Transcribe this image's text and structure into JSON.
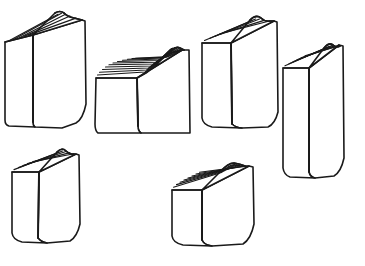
{
  "illustration": {
    "title": "Six books line drawing",
    "subject": "books",
    "style": "black-and-white hand-drawn line art",
    "item_count": 6,
    "rows": 2,
    "columns": 3,
    "canvas": {
      "width": 365,
      "height": 266
    },
    "colors": {
      "background": "#ffffff",
      "stroke": "#1a1a1a",
      "fill": "#ffffff"
    },
    "stroke_width": 1.6
  },
  "books": [
    {
      "name": "book-top-left",
      "row": 1,
      "column": 1,
      "proportion": "tall-medium-thickness",
      "page_line_count": 5,
      "geometry": {
        "cover_path": "M33 35 L82 20 L85 21 L86 104 Q83 119 76 123 L62 128 L35 127 Q33 126 33 122 Z",
        "spine_path": "M5 42 L33 35 L33 122 Q33 126 35 127 L9 126 Q5 125 5 120 Z",
        "top_face_path": "M5 42 L33 35 L55 13 Q60 10 64 13 Q68 17 74 18 L82 20 L33 35 Z",
        "spine_fold": "M33 35 L33 122",
        "page_lines": [
          "M9 40.8 L58 14.2",
          "M14 39.3 L61.5 13.3",
          "M19 37.9 L65 14.5",
          "M24 36.4 L70 16.0",
          "M28.5 35.1 L76 18.1"
        ],
        "top_rear_edge": "M55 13 Q60 10 64 13 Q68 17 74 18 L82 20"
      }
    },
    {
      "name": "book-top-center",
      "row": 1,
      "column": 2,
      "proportion": "thick-deep-top",
      "page_line_count": 11,
      "geometry": {
        "cover_path": "M137 78 L182 50 L189 50 L190 133 L141 133 Q138 131 138 126 Z",
        "spine_path": "M96 78 L137 78 L138 126 Q138 131 141 133 L98 133 Q95 131 95 124 Z",
        "top_face_path": "M96 78 L137 78 L146 73 Q152 69 158 63 L172 50 Q176 46 180 48 L184 50 L182 50 L137 78 Z",
        "spine_fold": "M137 78 L138 126",
        "page_lines": [
          "M97.5 75.0 L145.0 72.0 Q152 68 158 62 L170.5 49.5",
          "M99.5 72.2 L146.5 70.0 Q153 66 159 60.5 L171.5 48.5",
          "M102.5 69.5 L148.5 68.0 Q155 64 160.5 59.0 L173 48.0",
          "M105.5 67.0 L151.0 66.0 Q157 62 162.5 57.5 L175 47.8",
          "M109.0 64.8 L153.5 64.0 Q159 60 164.5 56.0 L177 48.0",
          "M113.0 63.0 L156.0 62.2 Q162 58.5 167 54.8 L179 48.6",
          "M117.5 61.5 L158.5 60.5 Q164 57 169 53.8 L180.5 49.4",
          "M122.5 60.2 L161.0 59.0 Q166.5 56 171 53.0 L181.5 50.0",
          "M127.5 59.3 L163.5 58.0 Q169 55 173 52.6 L182 50.2",
          "M132.0 58.6 L166.0 57.2 Q171 54.5 175 52.4 L182 50.3",
          "M135.5 58.2 L168.5 56.6 Q173 54.2 177 52.4 L182 50.4"
        ],
        "top_rear_edge": "M172 50 Q176 46 180 48 L184 50"
      }
    },
    {
      "name": "book-top-right",
      "row": 1,
      "column": 3,
      "proportion": "tall-wide",
      "page_line_count": 5,
      "geometry": {
        "cover_path": "M231 43 L274 21 L277 22 L278 112 Q275 124 268 127 L242 128 Q236 128 232 124 Z",
        "spine_path": "M202 43 L231 43 L232 124 Q236 128 242 128 L212 127 Q203 125 202 118 Z",
        "top_face_path": "M202 43 L231 43 L250 20 Q256 14 261 18 Q265 22 270 21 L274 21 L231 43 Z",
        "spine_fold": "M231 43 L232 124",
        "page_lines": [
          "M204.5 40.5 L252 20.5",
          "M209.5 38.5 L255.5 19.0",
          "M214.5 36.5 L259.5 19.0",
          "M219.5 34.4 L264 20.4",
          "M225 32.4 L269.5 21.0"
        ],
        "top_rear_edge": "M250 20 Q256 14 261 18 Q265 22 270 21 L274 21"
      }
    },
    {
      "name": "book-right-tall",
      "row": 1,
      "column": 4,
      "proportion": "tall-narrow",
      "page_line_count": 6,
      "geometry": {
        "cover_path": "M309 68 L339 45 L343 46 L344 158 Q341 172 334 176 L315 178 Q310 177 309 172 Z",
        "spine_path": "M283 68 L309 68 L309 172 Q310 177 315 178 L290 177 Q284 175 283 168 Z",
        "top_face_path": "M283 68 L309 68 L324 48 Q329 42 333 45 Q336 48 340 46 L339 45 L309 68 Z",
        "spine_fold": "M309 68 L309 172",
        "page_lines": [
          "M285.0 65.8 L326.0 48.0",
          "M289.0 63.8 L329.0 46.6",
          "M293.0 61.8 L332.0 45.6",
          "M297.0 59.8 L335.0 45.6",
          "M301.0 57.8 L337.5 46.0",
          "M305.0 55.8 L339.0 45.6"
        ],
        "top_rear_edge": "M324 48 Q329 42 333 45 Q336 48 340 46"
      }
    },
    {
      "name": "book-bottom-left",
      "row": 2,
      "column": 1,
      "proportion": "medium-height",
      "page_line_count": 5,
      "geometry": {
        "cover_path": "M39 172 L76 154 L79 155 L80 224 Q77 237 70 241 L47 243 Q41 242 38 238 Z",
        "spine_path": "M12 172 L39 172 L38 238 Q41 242 47 243 L22 242 Q13 240 12 233 Z",
        "top_face_path": "M12 172 L39 172 L57 152 Q62 147 66 151 Q70 155 74 154 L76 154 L39 172 Z",
        "spine_fold": "M39 172 L38 238",
        "page_lines": [
          "M14.0 169.6 L59.0 152.2",
          "M18.5 167.6 L62.5 151.0",
          "M23.0 165.6 L66.0 151.5",
          "M27.5 163.6 L70.0 152.6",
          "M33.0 161.6 L74.0 153.8"
        ],
        "top_rear_edge": "M57 152 Q62 147 66 151 Q70 155 74 154"
      }
    },
    {
      "name": "book-bottom-center",
      "row": 2,
      "column": 2,
      "proportion": "short-wide-thick",
      "page_line_count": 8,
      "geometry": {
        "cover_path": "M202 190 L249 166 L253 167 L254 224 Q251 239 243 244 L212 246 Q204 245 202 240 Z",
        "spine_path": "M172 190 L202 190 L202 240 Q204 245 212 246 L183 245 Q173 243 172 236 Z",
        "top_face_path": "M172 190 L202 190 L220 172 Q228 163 234 163 Q240 164 245 166 L249 166 L202 190 Z",
        "spine_fold": "M202 190 L202 240",
        "page_lines": [
          "M173.5 187.2 L221.5 172.5 Q229 164.5 234.5 164.5",
          "M176.5 184.6 L224.0 171.0 Q231 164.0 236.5 164.8",
          "M180.0 182.2 L226.5 169.8 Q233 164.0 238.0 165.2",
          "M184.0 180.0 L229.0 168.8 Q235 164.4 239.5 165.6",
          "M188.0 178.0 L232.0 168.0 Q237.5 165.0 241.5 166.0",
          "M192.0 176.0 L235.0 167.5 Q240 165.4 243.0 166.2",
          "M196.0 174.0 L239.0 167.0 Q243 165.8 245.5 166.4",
          "M199.5 172.2 L243.0 166.6 Q246 166.0 248.0 166.4"
        ],
        "top_rear_edge": "M220 172 Q228 163 234 163 Q240 164 245 166"
      }
    }
  ]
}
